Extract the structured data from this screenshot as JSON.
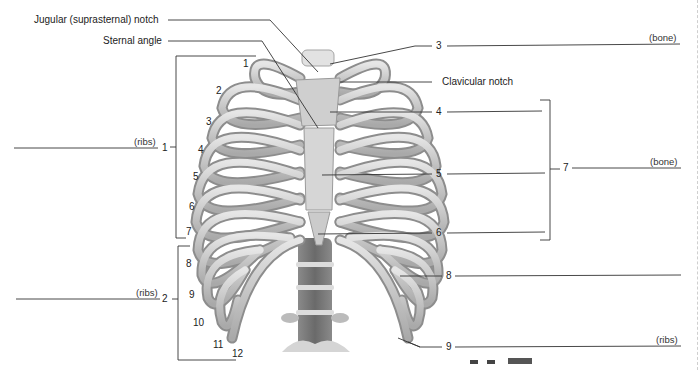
{
  "figure": {
    "labels": {
      "jugular_notch": "Jugular (suprasternal) notch",
      "sternal_angle": "Sternal angle",
      "clavicular_notch": "Clavicular notch"
    },
    "callouts": [
      {
        "number": "1",
        "hint": "(ribs)"
      },
      {
        "number": "2",
        "hint": "(ribs)"
      },
      {
        "number": "3",
        "hint": "(bone)"
      },
      {
        "number": "4",
        "hint": ""
      },
      {
        "number": "5",
        "hint": ""
      },
      {
        "number": "6",
        "hint": ""
      },
      {
        "number": "7",
        "hint": "(bone)"
      },
      {
        "number": "8",
        "hint": ""
      },
      {
        "number": "9",
        "hint": "(ribs)"
      }
    ],
    "rib_numbers": [
      "1",
      "2",
      "3",
      "4",
      "5",
      "6",
      "7",
      "8",
      "9",
      "10",
      "11",
      "12"
    ]
  }
}
